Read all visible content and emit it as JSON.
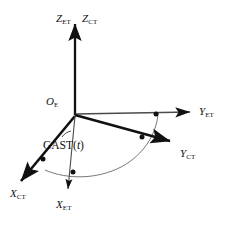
{
  "figure": {
    "origin_label": "O",
    "origin_subscript": "E",
    "angle_label_prefix": "GAST(",
    "angle_label_var": "t",
    "angle_label_suffix": ")",
    "line_color": "#111111",
    "arc_color": "#555555",
    "background": "#ffffff"
  },
  "axes": [
    {
      "id": "z-et",
      "name": "Z_ET",
      "base": "Z",
      "subscript": "ET",
      "style": "thin",
      "label_x": 56,
      "label_y": 13
    },
    {
      "id": "z-ct",
      "name": "Z_CT",
      "base": "Z",
      "subscript": "CT",
      "style": "thick",
      "label_x": 82,
      "label_y": 13
    },
    {
      "id": "y-et",
      "name": "Y_ET",
      "base": "Y",
      "subscript": "ET",
      "style": "thin",
      "label_x": 199,
      "label_y": 106
    },
    {
      "id": "y-ct",
      "name": "Y_CT",
      "base": "Y",
      "subscript": "CT",
      "style": "thick",
      "label_x": 180,
      "label_y": 148
    },
    {
      "id": "x-ct",
      "name": "X_CT",
      "base": "X",
      "subscript": "CT",
      "style": "thick",
      "label_x": 10,
      "label_y": 188
    },
    {
      "id": "x-et",
      "name": "X_ET",
      "base": "X",
      "subscript": "ET",
      "style": "thin",
      "label_x": 56,
      "label_y": 199
    }
  ],
  "markers": [
    {
      "id": "marker-y-et",
      "x": 156,
      "y": 114
    },
    {
      "id": "marker-y-ct",
      "x": 142,
      "y": 137
    },
    {
      "id": "marker-x-ct",
      "x": 43,
      "y": 159
    },
    {
      "id": "marker-x-et",
      "x": 73,
      "y": 172
    }
  ],
  "geometry": {
    "origin": {
      "x": 75,
      "y": 115
    },
    "z_tip": {
      "x": 75,
      "y": 20
    },
    "y_et_tip": {
      "x": 196,
      "y": 112
    },
    "y_ct_tip": {
      "x": 175,
      "y": 144
    },
    "x_ct_tip": {
      "x": 16,
      "y": 184
    },
    "x_et_tip": {
      "x": 68,
      "y": 194
    }
  }
}
